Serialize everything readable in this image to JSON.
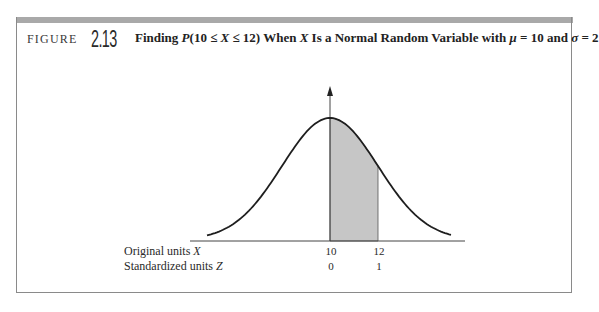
{
  "figure": {
    "label": "FIGURE",
    "number": "2.13",
    "caption": {
      "prefix": "Finding ",
      "prob": "P",
      "expr": "(10 ≤ ",
      "var1": "X",
      "expr2": " ≤ 12) When ",
      "var2": "X",
      "mid": " Is a Normal Random Variable with ",
      "mu": "μ",
      "mu_eq": " = 10 and ",
      "sigma": "σ",
      "sigma_eq": " = 2"
    }
  },
  "rows": {
    "original": {
      "label": "Original units ",
      "var": "X",
      "ticks": [
        "10",
        "12"
      ]
    },
    "standardized": {
      "label": "Standardized units ",
      "var": "Z",
      "ticks": [
        "0",
        "1"
      ]
    }
  },
  "colors": {
    "shade": "#c6c6c6",
    "curve": "#1e1e1e",
    "topbar": "#a9a9a9",
    "frame": "#8a8a8a"
  },
  "chart_data": {
    "type": "area",
    "title": "Finding P(10 ≤ X ≤ 12) When X Is a Normal Random Variable with μ = 10 and σ = 2",
    "distribution": "normal",
    "mu": 10,
    "sigma": 2,
    "shaded_interval": [
      10,
      12
    ],
    "x_ticks_original": [
      10,
      12
    ],
    "x_ticks_standardized": [
      0,
      1
    ],
    "xlabel_rows": [
      "Original units X",
      "Standardized units Z"
    ],
    "ylabel": "",
    "vertical_axis_at": 10,
    "grid": false,
    "legend": false
  }
}
